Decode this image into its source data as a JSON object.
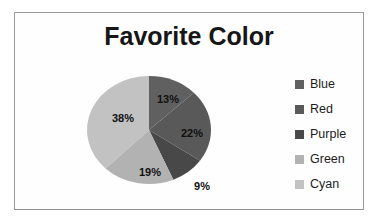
{
  "chart_data": {
    "type": "pie",
    "title": "Favorite Color",
    "categories": [
      "Blue",
      "Red",
      "Purple",
      "Green",
      "Cyan"
    ],
    "values": [
      13,
      22,
      9,
      19,
      38
    ],
    "slice_labels": [
      "13%",
      "22%",
      "9%",
      "19%",
      "38%"
    ],
    "colors": [
      "#606060",
      "#595959",
      "#484848",
      "#b2b2b2",
      "#c2c2c2"
    ],
    "legend_position": "right",
    "start_angle_deg": 0,
    "direction": "clockwise",
    "label_style": "percent",
    "rendering": "grayscale-print"
  }
}
